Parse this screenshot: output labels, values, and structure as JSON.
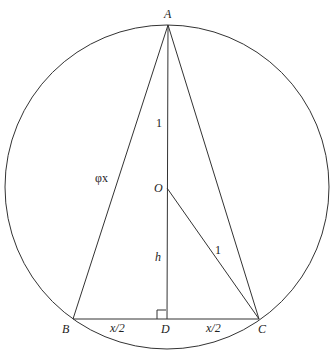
{
  "diagram": {
    "points": {
      "A": {
        "label": "A",
        "x": 168,
        "y": 25
      },
      "B": {
        "label": "B",
        "x": 73,
        "y": 319
      },
      "C": {
        "label": "C",
        "x": 259,
        "y": 319
      },
      "D": {
        "label": "D",
        "x": 167,
        "y": 319
      },
      "O": {
        "label": "O",
        "x": 167,
        "y": 188
      }
    },
    "circle": {
      "cx": 167,
      "cy": 187,
      "r": 162
    },
    "edge_labels": {
      "AO": "1",
      "OC": "1",
      "OD": "h",
      "AB": "φx",
      "BD": "x/2",
      "DC": "x/2"
    }
  }
}
